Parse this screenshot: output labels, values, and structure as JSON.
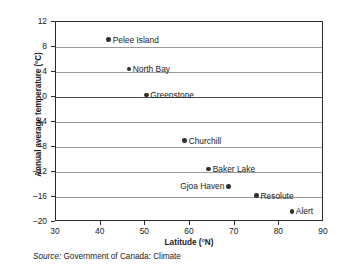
{
  "chart_data": {
    "type": "scatter",
    "title": "",
    "xlabel": "Latitude (°N)",
    "ylabel": "Annual average temperature (°C)",
    "xlim": [
      30,
      90
    ],
    "ylim": [
      -20,
      12
    ],
    "xticks": [
      30,
      40,
      50,
      60,
      70,
      80,
      90
    ],
    "yticks": [
      12,
      8,
      4,
      0,
      -4,
      -8,
      -12,
      -16,
      -20
    ],
    "xtick_labels": [
      "30",
      "40",
      "50",
      "60",
      "70",
      "80",
      "90"
    ],
    "ytick_labels": [
      "12",
      "8",
      "4",
      "0",
      "–4",
      "–8",
      "–12",
      "–16",
      "–20"
    ],
    "grid": "horizontal",
    "legend": "none",
    "marker_color": "#2f2f2f",
    "gridline_color": "#9a9a9a",
    "axis_color": "#2a2a2a",
    "points": [
      {
        "label": "Pelee Island",
        "x": 41.8,
        "y": 9.2,
        "label_side": "right"
      },
      {
        "label": "North Bay",
        "x": 46.3,
        "y": 4.5,
        "label_side": "right"
      },
      {
        "label": "Greenstone",
        "x": 50.2,
        "y": 0.3,
        "label_side": "right"
      },
      {
        "label": "Churchill",
        "x": 58.8,
        "y": -7.0,
        "label_side": "right"
      },
      {
        "label": "Baker Lake",
        "x": 64.2,
        "y": -11.5,
        "label_side": "right"
      },
      {
        "label": "Gjoa Haven",
        "x": 68.6,
        "y": -14.3,
        "label_side": "left"
      },
      {
        "label": "Resolute",
        "x": 74.9,
        "y": -15.8,
        "label_side": "right"
      },
      {
        "label": "Alert",
        "x": 82.8,
        "y": -18.3,
        "label_side": "right"
      }
    ]
  },
  "caption": {
    "source_word": "Source:",
    "source_text": " Government of Canada: Climate"
  }
}
